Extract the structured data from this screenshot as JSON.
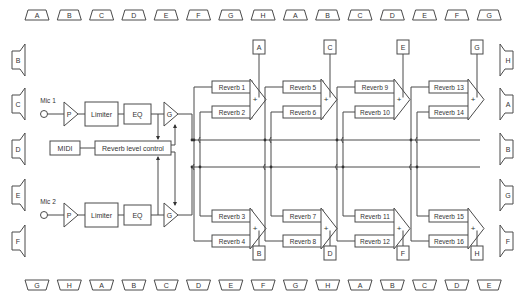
{
  "colors": {
    "line": "#4a4a4a",
    "text": "#333333",
    "background": "#ffffff"
  },
  "speakers": {
    "top": [
      "A",
      "B",
      "C",
      "D",
      "E",
      "F",
      "G",
      "H",
      "A",
      "B",
      "C",
      "D",
      "E",
      "F",
      "G"
    ],
    "bottom": [
      "G",
      "H",
      "A",
      "B",
      "C",
      "D",
      "E",
      "F",
      "G",
      "H",
      "A",
      "B",
      "C",
      "D",
      "E"
    ],
    "left": [
      "B",
      "C",
      "D",
      "E",
      "F"
    ],
    "right": [
      "H",
      "A",
      "B",
      "G",
      "F"
    ]
  },
  "inputs": [
    {
      "label": "Mic 1",
      "preamp": "P",
      "limiter": "Limiter",
      "eq": "EQ",
      "gain": "G"
    },
    {
      "label": "Mic 2",
      "preamp": "P",
      "limiter": "Limiter",
      "eq": "EQ",
      "gain": "G"
    }
  ],
  "control": {
    "midi": "MIDI",
    "reverb_level": "Reverb level control"
  },
  "reverbs": [
    "Reverb 1",
    "Reverb 2",
    "Reverb 3",
    "Reverb 4",
    "Reverb 5",
    "Reverb 6",
    "Reverb 7",
    "Reverb 8",
    "Reverb 9",
    "Reverb 10",
    "Reverb 11",
    "Reverb 12",
    "Reverb 13",
    "Reverb 14",
    "Reverb 15",
    "Reverb 16"
  ],
  "summers": {
    "symbol": "+"
  },
  "outputs": {
    "top": [
      "A",
      "C",
      "E",
      "G"
    ],
    "bottom": [
      "B",
      "D",
      "F",
      "H"
    ]
  }
}
